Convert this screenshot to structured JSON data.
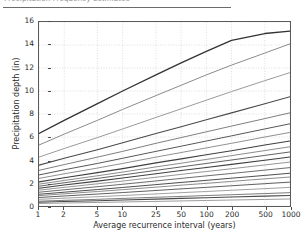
{
  "header": {
    "truncated_text": "Precipitation Frequency Estimates",
    "note": "partially cropped heading rule at top of screenshot"
  },
  "figure": {
    "ylabel": "Precipitation depth (in)",
    "xlabel": "Average recurrence interval (years)"
  },
  "chart_data": {
    "type": "line",
    "title": "",
    "subtitle": "",
    "xlabel": "Average recurrence interval (years)",
    "ylabel": "Precipitation depth (in)",
    "xscale": "log",
    "yscale": "linear",
    "xlim": [
      1,
      1000
    ],
    "ylim": [
      0,
      16
    ],
    "grid": true,
    "grid_style": "dotted",
    "legend": "none",
    "x": [
      1,
      2,
      5,
      10,
      25,
      50,
      100,
      200,
      500,
      1000
    ],
    "xticklabels": [
      "1",
      "2",
      "5",
      "10",
      "25",
      "50",
      "100",
      "200",
      "500",
      "1000"
    ],
    "yticks": [
      0,
      2,
      4,
      6,
      8,
      10,
      12,
      14,
      16
    ],
    "yticklabels": [
      "0",
      "2",
      "4",
      "6",
      "8",
      "10",
      "12",
      "14",
      "16"
    ],
    "series": [
      {
        "name": "60-day",
        "color": "#333333",
        "width": 1.3,
        "values": [
          6.3,
          7.45,
          8.9,
          10.0,
          11.4,
          12.45,
          13.45,
          14.4,
          15.0,
          15.2
        ]
      },
      {
        "name": "45-day",
        "color": "#8a8a8a",
        "width": 1.0,
        "values": [
          5.3,
          6.25,
          7.45,
          8.4,
          9.6,
          10.5,
          11.4,
          12.25,
          13.3,
          14.1
        ]
      },
      {
        "name": "30-day",
        "color": "#9a9a9a",
        "width": 1.0,
        "values": [
          4.25,
          5.0,
          5.95,
          6.7,
          7.7,
          8.45,
          9.2,
          9.95,
          10.9,
          11.6
        ]
      },
      {
        "name": "20-day",
        "color": "#4a4a4a",
        "width": 1.1,
        "values": [
          3.55,
          4.15,
          4.9,
          5.5,
          6.3,
          6.9,
          7.5,
          8.1,
          8.9,
          9.5
        ]
      },
      {
        "name": "15-day",
        "color": "#7d7d7d",
        "width": 1.0,
        "values": [
          3.1,
          3.6,
          4.25,
          4.75,
          5.45,
          5.95,
          6.45,
          6.95,
          7.6,
          8.1
        ]
      },
      {
        "name": "10-day",
        "color": "#555555",
        "width": 1.0,
        "values": [
          2.7,
          3.15,
          3.7,
          4.15,
          4.75,
          5.2,
          5.65,
          6.1,
          6.7,
          7.15
        ]
      },
      {
        "name": "7-day",
        "color": "#8f8f8f",
        "width": 1.0,
        "values": [
          2.4,
          2.8,
          3.3,
          3.7,
          4.25,
          4.65,
          5.05,
          5.45,
          6.0,
          6.4
        ]
      },
      {
        "name": "4-day",
        "color": "#3f3f3f",
        "width": 1.1,
        "values": [
          2.1,
          2.45,
          2.9,
          3.25,
          3.75,
          4.1,
          4.45,
          4.8,
          5.3,
          5.65
        ]
      },
      {
        "name": "3-day",
        "color": "#8a8a8a",
        "width": 1.0,
        "values": [
          1.9,
          2.22,
          2.63,
          2.95,
          3.4,
          3.72,
          4.05,
          4.38,
          4.82,
          5.15
        ]
      },
      {
        "name": "2-day",
        "color": "#606060",
        "width": 1.0,
        "values": [
          1.72,
          2.02,
          2.4,
          2.7,
          3.1,
          3.4,
          3.7,
          4.0,
          4.4,
          4.7
        ]
      },
      {
        "name": "24-hour",
        "color": "#404040",
        "width": 1.1,
        "values": [
          1.55,
          1.82,
          2.16,
          2.43,
          2.8,
          3.08,
          3.35,
          3.62,
          3.98,
          4.26
        ]
      },
      {
        "name": "12-hour",
        "color": "#959595",
        "width": 1.0,
        "values": [
          1.38,
          1.62,
          1.93,
          2.17,
          2.5,
          2.75,
          3.0,
          3.24,
          3.57,
          3.82
        ]
      },
      {
        "name": "6-hour",
        "color": "#6b6b6b",
        "width": 1.0,
        "values": [
          1.2,
          1.41,
          1.68,
          1.89,
          2.18,
          2.4,
          2.62,
          2.83,
          3.12,
          3.34
        ]
      },
      {
        "name": "3-hour",
        "color": "#4d4d4d",
        "width": 1.0,
        "values": [
          1.02,
          1.2,
          1.43,
          1.61,
          1.86,
          2.05,
          2.23,
          2.42,
          2.66,
          2.85
        ]
      },
      {
        "name": "2-hour",
        "color": "#8c8c8c",
        "width": 1.0,
        "values": [
          0.9,
          1.06,
          1.26,
          1.42,
          1.64,
          1.81,
          1.97,
          2.14,
          2.36,
          2.52
        ]
      },
      {
        "name": "60-min",
        "color": "#5e5e5e",
        "width": 1.0,
        "values": [
          0.74,
          0.87,
          1.04,
          1.17,
          1.35,
          1.49,
          1.62,
          1.76,
          1.94,
          2.08
        ]
      },
      {
        "name": "30-min",
        "color": "#a0a0a0",
        "width": 1.0,
        "values": [
          0.58,
          0.68,
          0.81,
          0.91,
          1.05,
          1.16,
          1.26,
          1.37,
          1.51,
          1.62
        ]
      },
      {
        "name": "15-min",
        "color": "#7a7a7a",
        "width": 1.0,
        "values": [
          0.42,
          0.49,
          0.58,
          0.66,
          0.76,
          0.83,
          0.91,
          0.98,
          1.08,
          1.16
        ]
      },
      {
        "name": "10-min",
        "color": "#4a4a4a",
        "width": 1.1,
        "values": [
          0.33,
          0.39,
          0.46,
          0.52,
          0.6,
          0.66,
          0.72,
          0.78,
          0.86,
          0.92
        ]
      },
      {
        "name": "5-min",
        "color": "#9c9c9c",
        "width": 1.0,
        "values": [
          0.22,
          0.26,
          0.31,
          0.35,
          0.4,
          0.44,
          0.48,
          0.52,
          0.57,
          0.61
        ]
      }
    ]
  },
  "colors": {
    "frame": "#5a5a5a",
    "grid": "#c8c8c8",
    "text": "#2a2a2a",
    "background": "#ffffff"
  }
}
